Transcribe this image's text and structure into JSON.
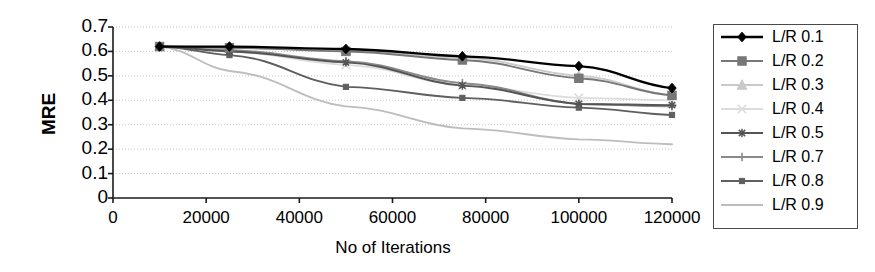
{
  "chart_data": {
    "type": "line",
    "title": "",
    "xlabel": "No of  Iterations",
    "ylabel": "MRE",
    "xlim": [
      0,
      120000
    ],
    "ylim": [
      0,
      0.7
    ],
    "xticks": [
      "0",
      "20000",
      "40000",
      "60000",
      "80000",
      "100000",
      "120000"
    ],
    "xtick_values": [
      0,
      20000,
      40000,
      60000,
      80000,
      100000,
      120000
    ],
    "yticks": [
      "0",
      "0.1",
      "0.2",
      "0.3",
      "0.4",
      "0.5",
      "0.6",
      "0.7"
    ],
    "ytick_values": [
      0,
      0.1,
      0.2,
      0.3,
      0.4,
      0.5,
      0.6,
      0.7
    ],
    "grid": true,
    "grid_axis": "y",
    "legend_position": "right",
    "x": [
      10000,
      25000,
      50000,
      75000,
      100000,
      120000
    ],
    "series": [
      {
        "name": "L/R 0.1",
        "marker": "diamond",
        "color": "#000000",
        "values": [
          0.62,
          0.62,
          0.61,
          0.58,
          0.54,
          0.45
        ]
      },
      {
        "name": "L/R 0.2",
        "marker": "square",
        "color": "#777777",
        "values": [
          0.62,
          0.615,
          0.6,
          0.565,
          0.49,
          0.42
        ]
      },
      {
        "name": "L/R 0.3",
        "marker": "triangle",
        "color": "#c9c9c9",
        "values": [
          0.62,
          0.615,
          0.605,
          0.575,
          0.5,
          0.42
        ]
      },
      {
        "name": "L/R 0.4",
        "marker": "x",
        "color": "#dcdcdc",
        "values": [
          0.62,
          0.6,
          0.545,
          0.46,
          0.41,
          0.4
        ]
      },
      {
        "name": "L/R 0.5",
        "marker": "asterisk",
        "color": "#555555",
        "values": [
          0.62,
          0.6,
          0.555,
          0.46,
          0.385,
          0.38
        ]
      },
      {
        "name": "L/R 0.7",
        "marker": "plus",
        "color": "#8a8a8a",
        "values": [
          0.62,
          0.605,
          0.56,
          0.47,
          0.385,
          0.375
        ]
      },
      {
        "name": "L/R 0.8",
        "marker": "dash-square",
        "color": "#5f5f5f",
        "values": [
          0.62,
          0.585,
          0.455,
          0.41,
          0.37,
          0.34
        ]
      },
      {
        "name": "L/R 0.9",
        "marker": "line",
        "color": "#bdbdbd",
        "values": [
          0.62,
          0.52,
          0.375,
          0.285,
          0.24,
          0.22
        ]
      }
    ]
  },
  "legend": {
    "items": [
      {
        "label": "L/R 0.1"
      },
      {
        "label": "L/R 0.2"
      },
      {
        "label": "L/R 0.3"
      },
      {
        "label": "L/R 0.4"
      },
      {
        "label": "L/R 0.5"
      },
      {
        "label": "L/R 0.7"
      },
      {
        "label": "L/R 0.8"
      },
      {
        "label": "L/R 0.9"
      }
    ]
  }
}
